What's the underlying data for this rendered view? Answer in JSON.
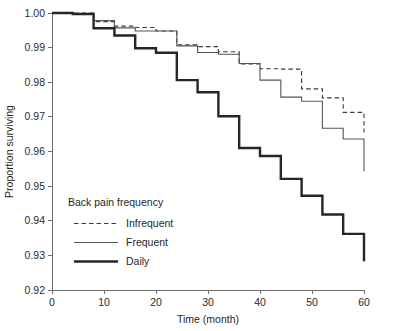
{
  "figure": {
    "top_fragment_text": "",
    "background_color": "#ffffff"
  },
  "axes": {
    "y_title": "Proportion surviving",
    "x_title": "Time (month)",
    "y_tick_labels": [
      "1.00",
      "0.99",
      "0.98",
      "0.97",
      "0.96",
      "0.95",
      "0.94",
      "0.93",
      "0.92"
    ],
    "x_tick_labels": [
      "0",
      "10",
      "20",
      "30",
      "40",
      "50",
      "60"
    ]
  },
  "legend": {
    "title": "Back pain frequency",
    "entries": [
      {
        "label": "Infrequent",
        "style": "dashed",
        "color": "#3a3a3a"
      },
      {
        "label": "Frequent",
        "style": "solid-thin",
        "color": "#555555"
      },
      {
        "label": "Daily",
        "style": "solid-thick",
        "color": "#262626"
      }
    ]
  },
  "chart_data": {
    "type": "line",
    "subtype": "kaplan-meier-step",
    "title": "",
    "xlabel": "Time (month)",
    "ylabel": "Proportion surviving",
    "xlim": [
      0,
      60
    ],
    "ylim": [
      0.92,
      1.0
    ],
    "xticks": [
      0,
      10,
      20,
      30,
      40,
      50,
      60
    ],
    "yticks": [
      0.92,
      0.93,
      0.94,
      0.95,
      0.96,
      0.97,
      0.98,
      0.99,
      1.0
    ],
    "grid": false,
    "legend_position": "inner-lower-left",
    "legend_title": "Back pain frequency",
    "x": [
      0,
      4,
      8,
      12,
      16,
      20,
      24,
      28,
      32,
      36,
      40,
      44,
      48,
      52,
      56,
      60
    ],
    "series": [
      {
        "name": "Infrequent",
        "style": "dashed",
        "color": "#3a3a3a",
        "values": [
          1.0,
          1.0,
          0.9975,
          0.9962,
          0.9958,
          0.9948,
          0.9908,
          0.9903,
          0.9888,
          0.9853,
          0.9839,
          0.9838,
          0.9781,
          0.9755,
          0.9713,
          0.9667
        ]
      },
      {
        "name": "Frequent",
        "style": "solid-thin",
        "color": "#555555",
        "values": [
          1.0,
          0.9997,
          0.9978,
          0.9957,
          0.9948,
          0.9948,
          0.9905,
          0.9886,
          0.9881,
          0.9854,
          0.9806,
          0.9757,
          0.9745,
          0.9667,
          0.9636,
          0.9598
        ]
      },
      {
        "name": "Daily",
        "style": "solid-thick",
        "color": "#262626",
        "values": [
          1.0,
          0.9997,
          0.9956,
          0.9935,
          0.9898,
          0.9885,
          0.9806,
          0.9771,
          0.9702,
          0.961,
          0.9587,
          0.9521,
          0.9472,
          0.9418,
          0.9362,
          0.9283
        ]
      }
    ],
    "endpoints": {
      "Infrequent": 0.9667,
      "Frequent": 0.9543,
      "Daily": 0.9283
    },
    "final_drops": {
      "Infrequent": 0.9655,
      "Frequent": 0.9543,
      "Daily": 0.9283
    }
  },
  "plot_geometry": {
    "left": 52,
    "right": 364,
    "top": 13,
    "bottom": 290
  }
}
